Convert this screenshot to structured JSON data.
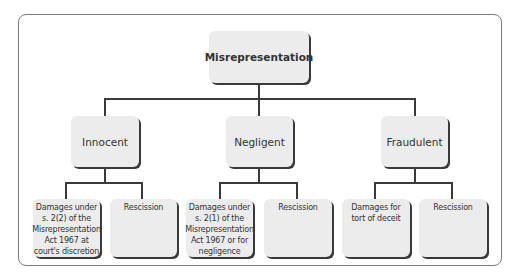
{
  "diagram": {
    "root": {
      "label": "Misrepresentation"
    },
    "branches": [
      {
        "label": "Innocent",
        "leaves": [
          {
            "label": "Damages under s. 2(2) of the Misrepresentation Act 1967 at court's discretion"
          },
          {
            "label": "Rescission"
          }
        ]
      },
      {
        "label": "Negligent",
        "leaves": [
          {
            "label": "Damages under s. 2(1) of the Misrepresentation Act 1967 or for negligence"
          },
          {
            "label": "Rescission"
          }
        ]
      },
      {
        "label": "Fraudulent",
        "leaves": [
          {
            "label": "Damages for tort of deceit"
          },
          {
            "label": "Rescission"
          }
        ]
      }
    ]
  }
}
